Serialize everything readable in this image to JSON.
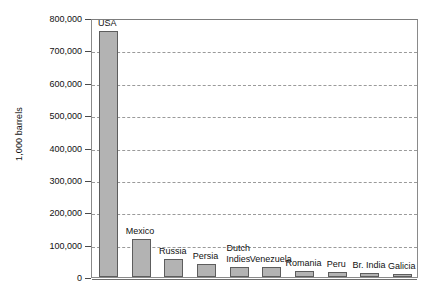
{
  "chart_data": {
    "type": "bar",
    "title": "",
    "xlabel": "",
    "ylabel": "1,000 barrels",
    "ylim": [
      0,
      800000
    ],
    "ytick_labels": [
      "800,000",
      "700,000",
      "600,000",
      "500,000",
      "400,000",
      "300,000",
      "200,000",
      "100,000",
      "0"
    ],
    "ytick_values": [
      800000,
      700000,
      600000,
      500000,
      400000,
      300000,
      200000,
      100000,
      0
    ],
    "grid": true,
    "legend": "none",
    "categories": [
      "USA",
      "Mexico",
      "Russia",
      "Persia",
      "Dutch Indies",
      "Venezuela",
      "Romania",
      "Peru",
      "Br. India",
      "Galicia"
    ],
    "values": [
      760000,
      118000,
      55000,
      40000,
      31000,
      30000,
      20000,
      15000,
      11000,
      9000
    ],
    "bars": [
      {
        "label": "USA",
        "value": 760000,
        "label_line1": "USA",
        "label_line2": ""
      },
      {
        "label": "Mexico",
        "value": 118000,
        "label_line1": "Mexico",
        "label_line2": ""
      },
      {
        "label": "Russia",
        "value": 55000,
        "label_line1": "Russia",
        "label_line2": ""
      },
      {
        "label": "Persia",
        "value": 40000,
        "label_line1": "Persia",
        "label_line2": ""
      },
      {
        "label": "Dutch Indies",
        "value": 31000,
        "label_line1": "Dutch",
        "label_line2": "Indies"
      },
      {
        "label": "Venezuela",
        "value": 30000,
        "label_line1": "Venezuela",
        "label_line2": ""
      },
      {
        "label": "Romania",
        "value": 20000,
        "label_line1": "Romania",
        "label_line2": ""
      },
      {
        "label": "Peru",
        "value": 15000,
        "label_line1": "Peru",
        "label_line2": ""
      },
      {
        "label": "Br. India",
        "value": 11000,
        "label_line1": "Br. India",
        "label_line2": ""
      },
      {
        "label": "Galicia",
        "value": 9000,
        "label_line1": "Galicia",
        "label_line2": ""
      }
    ],
    "colors": {
      "bar_fill": "#b3b3b3",
      "bar_border": "#5d5d5d",
      "gridline": "#9a9a9a",
      "frame": "#8a8a8a",
      "text": "#111111",
      "background": "#ffffff"
    }
  }
}
